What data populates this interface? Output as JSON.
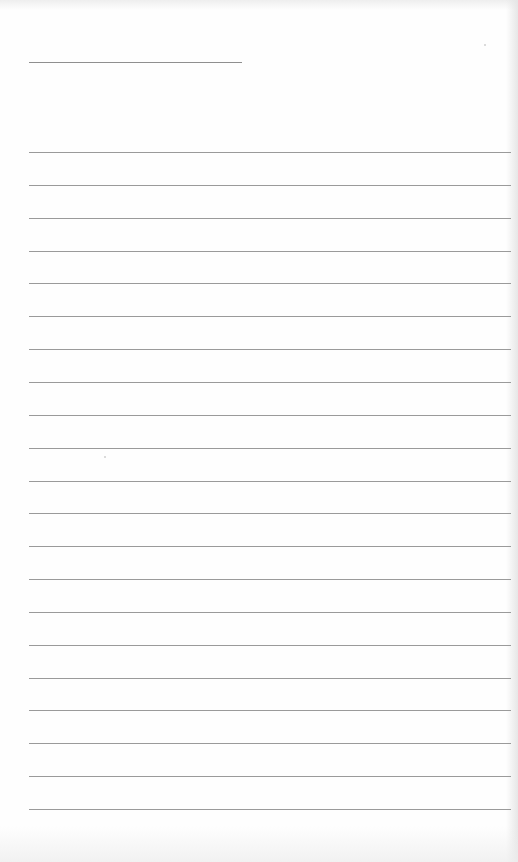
{
  "document": {
    "type": "lined-paper",
    "header_field": {
      "value": "",
      "line_y": 62,
      "line_x_start": 29,
      "line_x_end": 242
    },
    "lines": {
      "count": 21,
      "first_y": 152,
      "last_y": 809,
      "spacing": 32.85,
      "x_start": 29,
      "x_end": 511,
      "values": [
        "",
        "",
        "",
        "",
        "",
        "",
        "",
        "",
        "",
        "",
        "",
        "",
        "",
        "",
        "",
        "",
        "",
        "",
        "",
        "",
        ""
      ]
    },
    "colors": {
      "paper": "#fefefe",
      "rule": "#9a9a9a",
      "header_rule": "#8f8f8f"
    }
  }
}
